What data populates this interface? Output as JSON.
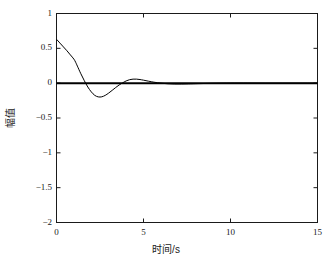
{
  "figure": {
    "background_color": "#ffffff",
    "line_color": "#000000",
    "frame_color": "#1a1a1a"
  },
  "chart_data": {
    "type": "line",
    "title": "",
    "xlabel": "时间/s",
    "ylabel": "幅值",
    "xlim": [
      0,
      15
    ],
    "ylim": [
      -2,
      1
    ],
    "grid": false,
    "legend": null,
    "xticks": [
      0,
      5,
      10,
      15
    ],
    "xticklabels": [
      "0",
      "5",
      "10",
      "15"
    ],
    "yticks": [
      -2,
      -1.5,
      -1,
      -0.5,
      0,
      0.5,
      1
    ],
    "yticklabels": [
      "-2",
      "-1.5",
      "-1",
      "-0.5",
      "0",
      "0.5",
      "1"
    ],
    "series": [
      {
        "name": "zero-reference",
        "color": "#000000",
        "linewidth": 2.0,
        "x": [
          0,
          15
        ],
        "values": [
          0,
          0
        ]
      },
      {
        "name": "damped-response",
        "color": "#000000",
        "linewidth": 1.0,
        "x": [
          0.0,
          0.2,
          0.4,
          0.6,
          0.8,
          1.0,
          1.1,
          1.2,
          1.4,
          1.6,
          1.8,
          2.0,
          2.2,
          2.4,
          2.6,
          2.8,
          3.0,
          3.2,
          3.4,
          3.6,
          3.8,
          4.0,
          4.2,
          4.4,
          4.6,
          4.8,
          5.0,
          5.3,
          5.6,
          6.0,
          6.4,
          6.8,
          7.2,
          7.6,
          8.0,
          8.6,
          9.2,
          10.0,
          11.0,
          12.0,
          13.0,
          14.0,
          15.0
        ],
        "values": [
          0.63,
          0.575,
          0.52,
          0.465,
          0.405,
          0.345,
          0.3,
          0.245,
          0.135,
          0.035,
          -0.055,
          -0.125,
          -0.175,
          -0.197,
          -0.196,
          -0.175,
          -0.142,
          -0.103,
          -0.063,
          -0.026,
          0.005,
          0.032,
          0.05,
          0.058,
          0.058,
          0.052,
          0.043,
          0.028,
          0.014,
          0.0,
          -0.009,
          -0.013,
          -0.013,
          -0.011,
          -0.008,
          -0.004,
          -0.001,
          0.001,
          0.001,
          0.0,
          0.0,
          0.0,
          0.0
        ]
      }
    ]
  }
}
